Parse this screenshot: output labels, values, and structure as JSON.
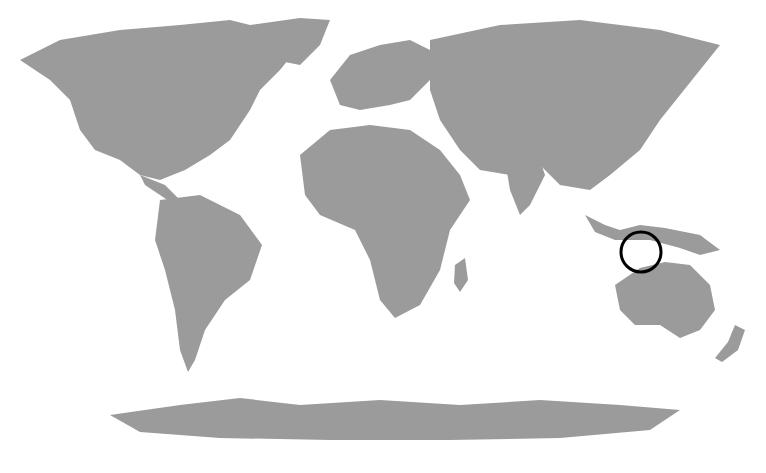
{
  "map": {
    "type": "world-locator-map",
    "projection": "equirectangular-like (Robinson style)",
    "land_color": "#9b9b9b",
    "ocean_color": "#ffffff",
    "marker": {
      "shape": "circle",
      "color": "#000000",
      "center_px": [
        641,
        252
      ],
      "radius_px": 20,
      "region": "Lesser Sunda Islands (Timor area), Indonesia"
    }
  }
}
